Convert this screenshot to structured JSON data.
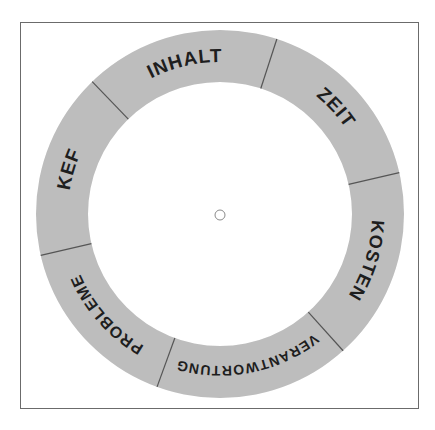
{
  "diagram": {
    "type": "ring-wheel",
    "center": {
      "x": 220,
      "y": 214
    },
    "outer_radius": 184,
    "inner_radius": 132,
    "ring_color": "#bdbdbd",
    "divider_color": "#555555",
    "segments": [
      {
        "label": "INHALT",
        "start_deg": 226,
        "end_deg": 288,
        "font_size": 19
      },
      {
        "label": "ZEIT",
        "start_deg": 288,
        "end_deg": 347,
        "font_size": 19
      },
      {
        "label": "KOSTEN",
        "start_deg": 347,
        "end_deg": 408,
        "font_size": 18
      },
      {
        "label": "VERANTWORTUNG",
        "start_deg": 48,
        "end_deg": 110,
        "font_size": 14
      },
      {
        "label": "PROBLEME",
        "start_deg": 110,
        "end_deg": 167,
        "font_size": 16
      },
      {
        "label": "KEF",
        "start_deg": 167,
        "end_deg": 226,
        "font_size": 19
      }
    ],
    "center_marker": {
      "radius": 5
    }
  }
}
